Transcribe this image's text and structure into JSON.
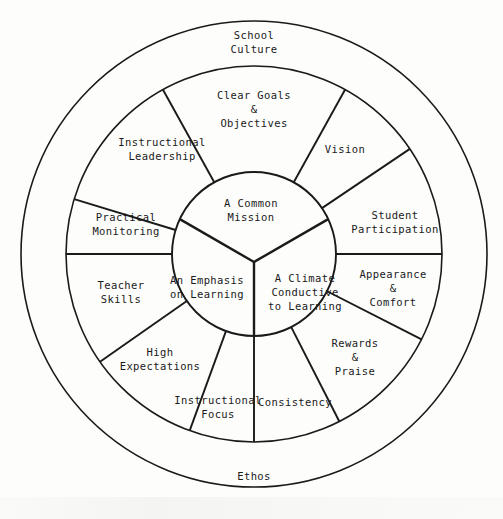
{
  "diagram": {
    "geometry": {
      "cx": 254,
      "cy": 254,
      "r_outer": 233,
      "r_middle": 188,
      "r_inner": 82,
      "core_junction_y": 262
    },
    "colors": {
      "line": "#1a1a1a",
      "background": "#fdfdfc",
      "text": "#1a1a1a"
    },
    "outer_ring": {
      "name": "outer-ring",
      "labels": [
        {
          "id": "school-culture",
          "lines": [
            "School",
            "Culture"
          ],
          "x": 254,
          "y": 43
        },
        {
          "id": "ethos",
          "lines": [
            "Ethos"
          ],
          "x": 254,
          "y": 477
        }
      ]
    },
    "middle_ring": {
      "name": "middle-ring",
      "segments": [
        {
          "id": "clear-goals-objectives",
          "lines": [
            "Clear Goals",
            "&",
            "Objectives"
          ],
          "x": 254,
          "y": 110,
          "start_deg": -61,
          "end_deg": -119
        },
        {
          "id": "instructional-leadership",
          "lines": [
            "Instructional",
            "Leadership"
          ],
          "x": 162,
          "y": 150,
          "start_deg": -119,
          "end_deg": -163
        },
        {
          "id": "practical-monitoring",
          "lines": [
            "Practical",
            "Monitoring"
          ],
          "x": 126,
          "y": 225,
          "start_deg": -163,
          "end_deg": 180
        },
        {
          "id": "teacher-skills",
          "lines": [
            "Teacher",
            "Skills"
          ],
          "x": 121,
          "y": 293,
          "start_deg": 180,
          "end_deg": 145
        },
        {
          "id": "high-expectations",
          "lines": [
            "High",
            "Expectations"
          ],
          "x": 160,
          "y": 360,
          "start_deg": 145,
          "end_deg": 110
        },
        {
          "id": "instructional-focus",
          "lines": [
            "Instructional",
            "Focus"
          ],
          "x": 218,
          "y": 408,
          "start_deg": 110,
          "end_deg": 90
        },
        {
          "id": "consistency",
          "lines": [
            "Consistency"
          ],
          "x": 295,
          "y": 403,
          "start_deg": 90,
          "end_deg": 63
        },
        {
          "id": "rewards-praise",
          "lines": [
            "Rewards",
            "&",
            "Praise"
          ],
          "x": 355,
          "y": 358,
          "start_deg": 63,
          "end_deg": 27
        },
        {
          "id": "appearance-comfort",
          "lines": [
            "Appearance",
            "&",
            "Comfort"
          ],
          "x": 393,
          "y": 289,
          "start_deg": 27,
          "end_deg": 0
        },
        {
          "id": "student-participation",
          "lines": [
            "Student",
            "Participation"
          ],
          "x": 395,
          "y": 223,
          "start_deg": 0,
          "end_deg": -34
        },
        {
          "id": "vision",
          "lines": [
            "Vision"
          ],
          "x": 345,
          "y": 150,
          "start_deg": -34,
          "end_deg": -61
        }
      ]
    },
    "core": {
      "name": "core-circle",
      "sectors": [
        {
          "id": "a-common-mission",
          "lines": [
            "A Common",
            "Mission"
          ],
          "x": 251,
          "y": 211
        },
        {
          "id": "an-emphasis-on-learning",
          "lines": [
            "An Emphasis",
            "on Learning"
          ],
          "x": 207,
          "y": 288
        },
        {
          "id": "a-climate-conductive-to-learning",
          "lines": [
            "A Climate",
            "Conductive",
            "to Learning"
          ],
          "x": 305,
          "y": 293
        }
      ]
    }
  }
}
